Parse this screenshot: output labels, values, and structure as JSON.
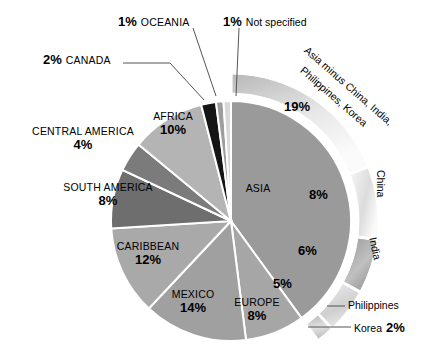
{
  "chart_data": {
    "type": "pie",
    "title": "",
    "subtitle": "",
    "xlabel": "",
    "ylabel": "",
    "grid": false,
    "legend_position": "labels-on-slices",
    "unit": "%",
    "total": 100,
    "categories": [
      "ASIA",
      "EUROPE",
      "MEXICO",
      "CARIBBEAN",
      "SOUTH AMERICA",
      "CENTRAL AMERICA",
      "AFRICA",
      "CANADA",
      "OCEANIA",
      "Not specified"
    ],
    "values": [
      40,
      8,
      14,
      12,
      8,
      4,
      10,
      2,
      1,
      1
    ],
    "slices": [
      {
        "label": "ASIA",
        "value": 40,
        "display": "",
        "color": "#9a9a9a"
      },
      {
        "label": "EUROPE",
        "value": 8,
        "display": "8%",
        "color": "#a6a6a6"
      },
      {
        "label": "MEXICO",
        "value": 14,
        "display": "14%",
        "color": "#a0a0a0"
      },
      {
        "label": "CARIBBEAN",
        "value": 12,
        "display": "12%",
        "color": "#a9a9a9"
      },
      {
        "label": "SOUTH AMERICA",
        "value": 8,
        "display": "8%",
        "color": "#6e6e6e"
      },
      {
        "label": "CENTRAL AMERICA",
        "value": 4,
        "display": "4%",
        "color": "#7b7b7b"
      },
      {
        "label": "AFRICA",
        "value": 10,
        "display": "10%",
        "color": "#b4b4b4"
      },
      {
        "label": "CANADA",
        "value": 2,
        "display": "2%",
        "color": "#151515"
      },
      {
        "label": "OCEANIA",
        "value": 1,
        "display": "1%",
        "color": "#9d9d9d"
      },
      {
        "label": "Not specified",
        "value": 1,
        "display": "1%",
        "color": "#d9d9d9"
      }
    ],
    "outer_ring": {
      "parent": "ASIA",
      "parent_total": 40,
      "segments": [
        {
          "label": "Asia minus China, India, Philippines, Korea",
          "value": 19,
          "display": "19%"
        },
        {
          "label": "China",
          "value": 8,
          "display": "8%"
        },
        {
          "label": "India",
          "value": 6,
          "display": "6%"
        },
        {
          "label": "Philippines",
          "value": 5,
          "display": "5%"
        },
        {
          "label": "Korea",
          "value": 2,
          "display": "2%"
        }
      ]
    }
  },
  "labels": {
    "asia": "ASIA",
    "europe": "EUROPE",
    "europe_pct": "8%",
    "mexico": "MEXICO",
    "mexico_pct": "14%",
    "caribbean": "CARIBBEAN",
    "caribbean_pct": "12%",
    "south_america": "SOUTH AMERICA",
    "south_america_pct": "8%",
    "central_america": "CENTRAL AMERICA",
    "central_america_pct": "4%",
    "africa": "AFRICA",
    "africa_pct": "10%",
    "canada": "CANADA",
    "canada_pct": "2%",
    "oceania": "OCEANIA",
    "oceania_pct": "1%",
    "not_specified": "Not specified",
    "not_specified_pct": "1%",
    "asia_rest_line1": "Asia minus China, India,",
    "asia_rest_line2": "Philippines, Korea",
    "asia_rest_pct": "19%",
    "china": "China",
    "china_pct": "8%",
    "india": "India",
    "india_pct": "6%",
    "philippines": "Philippines",
    "philippines_pct": "5%",
    "korea": "Korea",
    "korea_pct": "2%"
  },
  "colors": {
    "background": "#ffffff",
    "text": "#000000",
    "slice_divider": "#ffffff",
    "asia": "#9a9a9a",
    "europe": "#a6a6a6",
    "mexico": "#a0a0a0",
    "caribbean": "#a9a9a9",
    "south_america": "#6e6e6e",
    "central_america": "#7b7b7b",
    "africa": "#b4b4b4",
    "canada": "#151515",
    "oceania": "#9d9d9d",
    "not_specified": "#d9d9d9",
    "ring_light": "#f2f2f2",
    "ring_mid": "#c8c8c8",
    "ring_dark": "#8e8e8e",
    "leader_line": "#555555"
  }
}
